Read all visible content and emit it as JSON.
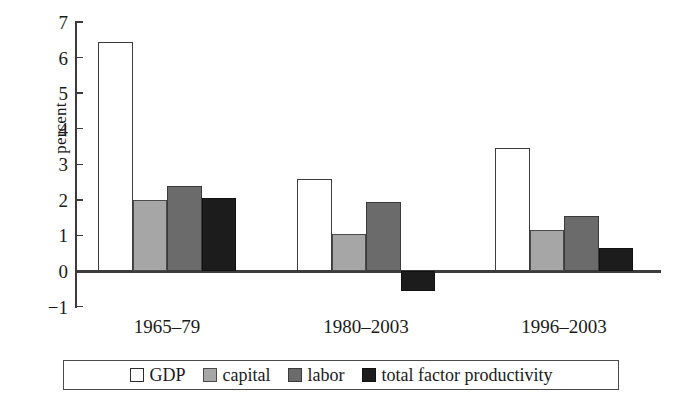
{
  "chart_data": {
    "type": "bar",
    "title": "",
    "xlabel": "",
    "ylabel": "percent",
    "categories": [
      "1965–79",
      "1980–2003",
      "1996–2003"
    ],
    "series": [
      {
        "name": "GDP",
        "color": "#ffffff",
        "values": [
          6.45,
          2.6,
          3.45
        ]
      },
      {
        "name": "capital",
        "color": "#a6a6a6",
        "values": [
          2.0,
          1.05,
          1.15
        ]
      },
      {
        "name": "labor",
        "color": "#6b6b6b",
        "values": [
          2.4,
          1.95,
          1.55
        ]
      },
      {
        "name": "total factor productivity",
        "color": "#1c1c1c",
        "values": [
          2.05,
          -0.55,
          0.65
        ]
      }
    ],
    "ylim": [
      -1,
      7
    ],
    "ytick_labels": [
      "7",
      "6",
      "5",
      "4",
      "3",
      "2",
      "1",
      "0",
      "−1"
    ],
    "ytick_values": [
      7,
      6,
      5,
      4,
      3,
      2,
      1,
      0,
      -1
    ],
    "grid": false,
    "legend_position": "bottom"
  },
  "axis": {
    "y_title": "percent"
  },
  "legend": {
    "items": [
      {
        "label": "GDP"
      },
      {
        "label": "capital"
      },
      {
        "label": "labor"
      },
      {
        "label": "total factor productivity"
      }
    ]
  }
}
